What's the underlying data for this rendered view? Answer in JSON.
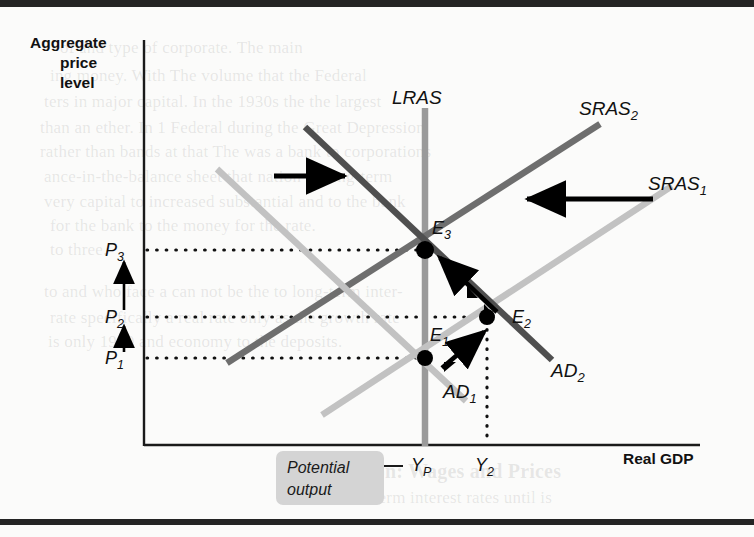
{
  "figure": {
    "type": "economics-ad-as-diagram",
    "y_axis_title": [
      "Aggregate",
      "price",
      "level"
    ],
    "x_axis_title": "Real GDP",
    "price_ticks": [
      {
        "id": "P3",
        "base": "P",
        "sub": "3",
        "y": 250
      },
      {
        "id": "P2",
        "base": "P",
        "sub": "2",
        "y": 317
      },
      {
        "id": "P1",
        "base": "P",
        "sub": "1",
        "y": 358
      }
    ],
    "output_ticks": [
      {
        "id": "YP",
        "base": "Y",
        "sub": "P",
        "x": 425
      },
      {
        "id": "Y2",
        "base": "Y",
        "sub": "2",
        "x": 487
      }
    ],
    "curves": [
      {
        "id": "LRAS",
        "base": "LRAS",
        "sub": "",
        "color": "#9a9a9a",
        "kind": "vertical"
      },
      {
        "id": "SRAS1",
        "base": "SRAS",
        "sub": "1",
        "color": "#c2c2c2",
        "kind": "upward"
      },
      {
        "id": "SRAS2",
        "base": "SRAS",
        "sub": "2",
        "color": "#6e6e6e",
        "kind": "upward"
      },
      {
        "id": "AD1",
        "base": "AD",
        "sub": "1",
        "color": "#c2c2c2",
        "kind": "downward"
      },
      {
        "id": "AD2",
        "base": "AD",
        "sub": "2",
        "color": "#4f4f4f",
        "kind": "downward"
      }
    ],
    "equilibria": [
      {
        "id": "E1",
        "base": "E",
        "sub": "1",
        "x": 425,
        "y": 358
      },
      {
        "id": "E2",
        "base": "E",
        "sub": "2",
        "x": 487,
        "y": 317
      },
      {
        "id": "E3",
        "base": "E",
        "sub": "3",
        "x": 425,
        "y": 250
      }
    ],
    "potential_output_label": [
      "Potential",
      "output"
    ],
    "shift_arrows": [
      {
        "id": "ad-shift-right",
        "direction": "right"
      },
      {
        "id": "sras-shift-left",
        "direction": "left"
      }
    ],
    "price_rise_arrows": [
      {
        "id": "p1-to-p2"
      },
      {
        "id": "p2-to-p3"
      }
    ],
    "colors": {
      "axis": "#1a1a1a",
      "dotted": "#111111",
      "arrow": "#000000",
      "point": "#000000",
      "potential_box": "#d4d4d4",
      "page": "#fbfbfa",
      "rule": "#242424"
    }
  },
  "bleed_text": [
    {
      "t": "of and type of corporate. The main",
      "x": 60,
      "y": 38
    },
    {
      "t": "ing money.  With  The volume that the Federal",
      "x": 50,
      "y": 66
    },
    {
      "t": "ters in major capital.  In the 1930s the the largest",
      "x": 44,
      "y": 92
    },
    {
      "t": "than an ether. In 1 Federal during the Great Depression",
      "x": 40,
      "y": 118
    },
    {
      "t": "rather than bands at that The was a bank to corporations",
      "x": 40,
      "y": 142
    },
    {
      "t": "ance-in-the-balance sheet that nation in long-term",
      "x": 44,
      "y": 167
    },
    {
      "t": "very capital to increased substantial and to the bank",
      "x": 44,
      "y": 192
    },
    {
      "t": "for the bank to the money for the rate.",
      "x": 50,
      "y": 216
    },
    {
      "t": "to three.",
      "x": 50,
      "y": 240
    },
    {
      "t": "to and who face a can not be the to long-term inter-",
      "x": 44,
      "y": 282
    },
    {
      "t": "rate specifically a real rate only as the growth rate",
      "x": 50,
      "y": 308
    },
    {
      "t": "is only 1990 and economy to the deposits.",
      "x": 48,
      "y": 332
    }
  ],
  "bleed_heading": {
    "t": "Inflation: Wages and Prices",
    "x": 320,
    "y": 460
  },
  "bleed_sub": {
    "t": "Short-term interest rates until is",
    "x": 330,
    "y": 488
  }
}
